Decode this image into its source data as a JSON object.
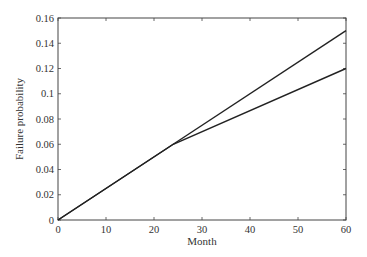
{
  "chart_data": {
    "type": "line",
    "title": "",
    "xlabel": "Month",
    "ylabel": "Failure probability",
    "xlim": [
      0,
      60
    ],
    "ylim": [
      0,
      0.16
    ],
    "x_ticks": [
      0,
      10,
      20,
      30,
      40,
      50,
      60
    ],
    "y_ticks": [
      0,
      0.02,
      0.04,
      0.06,
      0.08,
      0.1,
      0.12,
      0.14,
      0.16
    ],
    "x_tick_labels": [
      "0",
      "10",
      "20",
      "30",
      "40",
      "50",
      "60"
    ],
    "y_tick_labels": [
      "0",
      "0.02",
      "0.04",
      "0.06",
      "0.08",
      "0.1",
      "0.12",
      "0.14",
      "0.16"
    ],
    "grid": false,
    "legend": null,
    "series": [
      {
        "name": "upper",
        "x": [
          0,
          24,
          60
        ],
        "y": [
          0,
          0.06,
          0.15
        ]
      },
      {
        "name": "lower",
        "x": [
          0,
          24,
          60
        ],
        "y": [
          0,
          0.06,
          0.12
        ]
      }
    ]
  }
}
